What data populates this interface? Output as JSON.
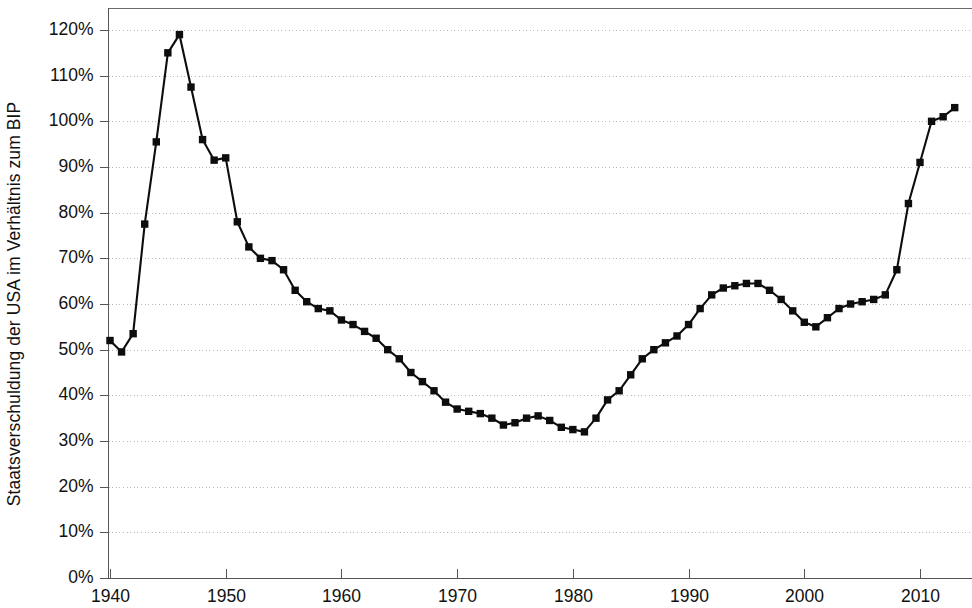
{
  "chart_data": {
    "type": "line",
    "title": "",
    "xlabel": "",
    "ylabel": "Staatsverschuldung der USA im Verhältnis zum BIP",
    "xlim": [
      1939,
      2014
    ],
    "ylim": [
      0,
      125
    ],
    "grid": true,
    "legend": false,
    "marker": "square",
    "line_color": "#0d0d0d",
    "y_tick_labels": [
      "120%",
      "110%",
      "100%",
      "90%",
      "80%",
      "70%",
      "60%",
      "50%",
      "40%",
      "30%",
      "20%",
      "10%",
      "0%"
    ],
    "y_tick_values": [
      120,
      110,
      100,
      90,
      80,
      70,
      60,
      50,
      40,
      30,
      20,
      10,
      0
    ],
    "x_tick_labels": [
      "1940",
      "1950",
      "1960",
      "1970",
      "1980",
      "1990",
      "2000",
      "2010"
    ],
    "x_tick_values": [
      1940,
      1950,
      1960,
      1970,
      1980,
      1990,
      2000,
      2010
    ],
    "x": [
      1940,
      1941,
      1942,
      1943,
      1944,
      1945,
      1946,
      1947,
      1948,
      1949,
      1950,
      1951,
      1952,
      1953,
      1954,
      1955,
      1956,
      1957,
      1958,
      1959,
      1960,
      1961,
      1962,
      1963,
      1964,
      1965,
      1966,
      1967,
      1968,
      1969,
      1970,
      1971,
      1972,
      1973,
      1974,
      1975,
      1976,
      1977,
      1978,
      1979,
      1980,
      1981,
      1982,
      1983,
      1984,
      1985,
      1986,
      1987,
      1988,
      1989,
      1990,
      1991,
      1992,
      1993,
      1994,
      1995,
      1996,
      1997,
      1998,
      1999,
      2000,
      2001,
      2002,
      2003,
      2004,
      2005,
      2006,
      2007,
      2008,
      2009,
      2010,
      2011,
      2012,
      2013
    ],
    "values": [
      52.0,
      49.5,
      53.5,
      77.5,
      95.5,
      115.0,
      119.0,
      107.5,
      96.0,
      91.5,
      92.0,
      78.0,
      72.5,
      70.0,
      69.5,
      67.5,
      63.0,
      60.5,
      59.0,
      58.5,
      56.5,
      55.5,
      54.0,
      52.5,
      50.0,
      48.0,
      45.0,
      43.0,
      41.0,
      38.5,
      37.0,
      36.5,
      36.0,
      35.0,
      33.5,
      34.0,
      35.0,
      35.5,
      34.5,
      33.0,
      32.5,
      32.0,
      35.0,
      39.0,
      41.0,
      44.5,
      48.0,
      50.0,
      51.5,
      53.0,
      55.5,
      59.0,
      62.0,
      63.5,
      64.0,
      64.5,
      64.5,
      63.0,
      61.0,
      58.5,
      56.0,
      55.0,
      57.0,
      59.0,
      60.0,
      60.5,
      61.0,
      62.0,
      67.5,
      82.0,
      91.0,
      100.0,
      101.0,
      103.0
    ]
  }
}
